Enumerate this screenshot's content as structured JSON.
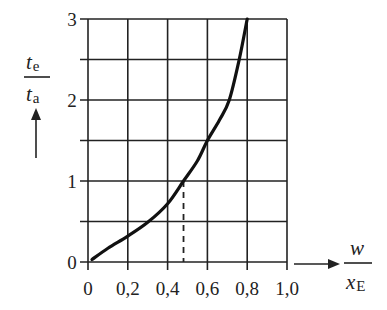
{
  "chart_data": {
    "type": "line",
    "title": "",
    "xlabel": "w / x_E",
    "ylabel": "t_e / t_a",
    "xlabel_parts": {
      "num": "w",
      "den_main": "x",
      "den_sub": "E"
    },
    "ylabel_parts": {
      "num_main": "t",
      "num_sub": "e",
      "den_main": "t",
      "den_sub": "a"
    },
    "xlim": [
      0,
      1.0
    ],
    "ylim": [
      0,
      3
    ],
    "x_ticks": [
      "0",
      "0,2",
      "0,4",
      "0,6",
      "0,8",
      "1,0"
    ],
    "x_tick_values": [
      0,
      0.2,
      0.4,
      0.6,
      0.8,
      1.0
    ],
    "y_ticks": [
      "0",
      "1",
      "2",
      "3"
    ],
    "y_tick_values": [
      0,
      1,
      2,
      3
    ],
    "y_gridlines": [
      0,
      0.5,
      1,
      1.5,
      2,
      2.5,
      3
    ],
    "x_gridlines": [
      0,
      0.2,
      0.4,
      0.6,
      0.8,
      1.0
    ],
    "grid": true,
    "legend": null,
    "series": [
      {
        "name": "t_e/t_a",
        "x": [
          0.02,
          0.1,
          0.2,
          0.3,
          0.4,
          0.48,
          0.55,
          0.6,
          0.66,
          0.71,
          0.76,
          0.8
        ],
        "y": [
          0.03,
          0.17,
          0.32,
          0.49,
          0.72,
          1.0,
          1.25,
          1.5,
          1.75,
          2.0,
          2.5,
          3.0
        ]
      }
    ],
    "annotations": [
      {
        "type": "dashed-vertical",
        "x": 0.48,
        "y_from": 0,
        "y_to": 1.0,
        "note": "reading at t_e/t_a = 1"
      }
    ]
  }
}
